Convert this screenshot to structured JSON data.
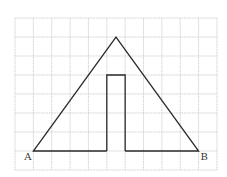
{
  "diagram": {
    "type": "geometry-grid-figure",
    "grid": {
      "columns": 11,
      "rows": 8,
      "origin_px": [
        15,
        18
      ],
      "cell_w": 18.36,
      "cell_h": 19,
      "line_color": "#c8c8c8"
    },
    "shape_color": "#2a2a2a",
    "points": {
      "A": {
        "label": "A",
        "grid": [
          1,
          7
        ]
      },
      "B": {
        "label": "B",
        "grid": [
          10,
          7
        ]
      },
      "apex": {
        "label": "",
        "grid": [
          5.5,
          1
        ]
      }
    },
    "figure": {
      "description": "Triangle with base AB on grid line, apex above center; a vertical rectangular notch (1 column wide, 4 rows tall) rising from the base in the middle",
      "outline_grid": [
        [
          1,
          7
        ],
        [
          5.5,
          1
        ],
        [
          10,
          7
        ],
        [
          6,
          7
        ],
        [
          6,
          3
        ],
        [
          5,
          3
        ],
        [
          5,
          7
        ],
        [
          1,
          7
        ]
      ]
    },
    "labels": {
      "a": "A",
      "b": "B"
    }
  }
}
